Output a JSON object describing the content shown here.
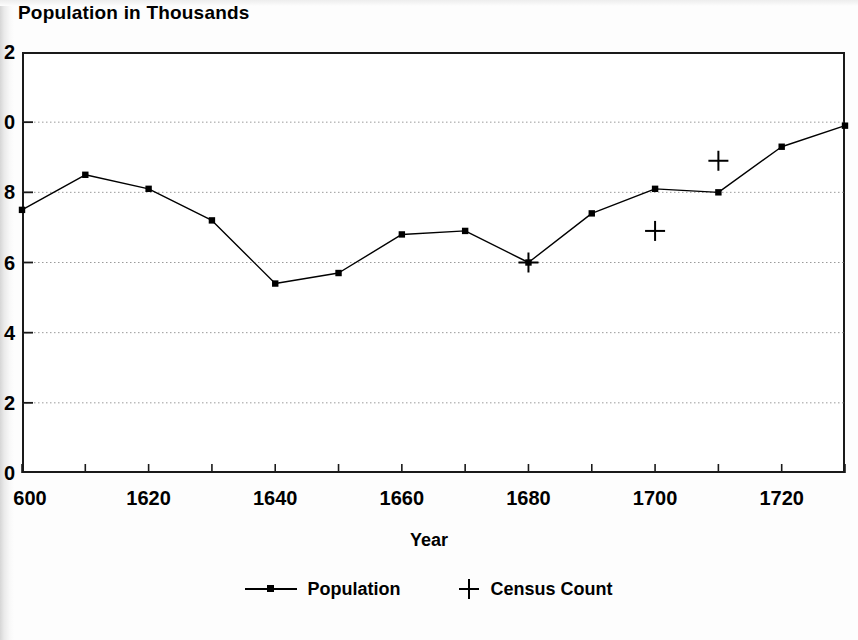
{
  "chart_data": {
    "type": "line",
    "title": "Population in Thousands",
    "xlabel": "Year",
    "ylabel": "",
    "xlim": [
      1600,
      1730
    ],
    "ylim": [
      0,
      12
    ],
    "grid": true,
    "grid_axis": "y",
    "legend_position": "bottom-center",
    "x": [
      1600,
      1610,
      1620,
      1630,
      1640,
      1650,
      1660,
      1670,
      1680,
      1690,
      1700,
      1710,
      1720,
      1730
    ],
    "series": [
      {
        "name": "Population",
        "marker": "square-dot",
        "style": "line",
        "values": [
          7.5,
          8.5,
          8.1,
          7.2,
          5.4,
          5.7,
          6.8,
          6.9,
          6.0,
          7.4,
          8.1,
          8.0,
          9.3,
          9.9
        ]
      },
      {
        "name": "Census Count",
        "marker": "plus",
        "style": "points-only",
        "points": [
          {
            "x": 1680,
            "y": 6.0
          },
          {
            "x": 1700,
            "y": 6.9
          },
          {
            "x": 1710,
            "y": 8.9
          }
        ]
      }
    ],
    "yticks": [
      0,
      2,
      4,
      6,
      8,
      10,
      12
    ],
    "ytick_labels_visible": [
      "0",
      "2",
      "4",
      "6",
      "8",
      "0",
      "2"
    ],
    "ytick_labels_note": "left-clipped by page edge; true values 0,2,4,6,8,10,12",
    "xticks": [
      1600,
      1610,
      1620,
      1630,
      1640,
      1650,
      1660,
      1670,
      1680,
      1690,
      1700,
      1710,
      1720,
      1730
    ],
    "xtick_labels": [
      {
        "value": 1600,
        "text": "600"
      },
      {
        "value": 1620,
        "text": "1620"
      },
      {
        "value": 1640,
        "text": "1640"
      },
      {
        "value": 1660,
        "text": "1660"
      },
      {
        "value": 1680,
        "text": "1680"
      },
      {
        "value": 1700,
        "text": "1700"
      },
      {
        "value": 1720,
        "text": "1720"
      }
    ],
    "colors": {
      "line": "#000000",
      "marker": "#000000",
      "grid": "#9a9a9a",
      "axis": "#1a1a1a",
      "background": "#ffffff"
    }
  },
  "legend": {
    "items": [
      {
        "label": "Population",
        "marker": "line-with-dot"
      },
      {
        "label": "Census Count",
        "marker": "plus"
      }
    ]
  }
}
